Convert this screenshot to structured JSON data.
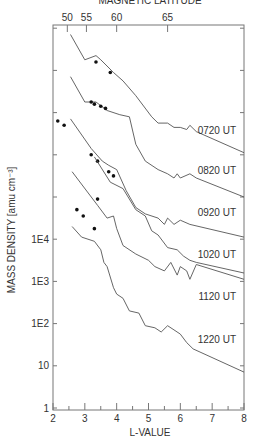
{
  "chart_data": {
    "type": "line",
    "title": "MAGNETIC LATITUDE",
    "xlabel": "L-VALUE",
    "ylabel": "MASS DENSITY [amu cm⁻³]",
    "x_range": [
      2,
      8
    ],
    "x_ticks": [
      "2",
      "3",
      "4",
      "5",
      "6",
      "7",
      "8"
    ],
    "top_axis": {
      "label": "MAGNETIC LATITUDE",
      "ticks": [
        {
          "label": "50",
          "L": 2.45
        },
        {
          "label": "55",
          "L": 3.05
        },
        {
          "label": "60",
          "L": 4.0
        },
        {
          "label": "65",
          "L": 5.6
        }
      ]
    },
    "y_scale": "log (curves offset by one decade each for clarity)",
    "y_tick_labels": [
      {
        "label": "1",
        "decade": 0
      },
      {
        "label": "10",
        "decade": 1
      },
      {
        "label": "1E2",
        "decade": 2
      },
      {
        "label": "1E3",
        "decade": 3
      },
      {
        "label": "1E4",
        "decade": 4
      }
    ],
    "y_extra_ticks_decades": [
      5,
      6,
      7,
      8,
      9
    ],
    "grid": false,
    "legend": "inline labels at right",
    "series": [
      {
        "name": "0720 UT",
        "points": [
          [
            2.55,
            8.85
          ],
          [
            3.0,
            8.25
          ],
          [
            3.35,
            8.35
          ],
          [
            3.5,
            8.25
          ],
          [
            3.9,
            7.95
          ],
          [
            4.2,
            7.75
          ],
          [
            4.6,
            7.4
          ],
          [
            5.1,
            6.9
          ],
          [
            5.3,
            6.75
          ],
          [
            5.6,
            6.75
          ],
          [
            5.8,
            6.65
          ],
          [
            6.0,
            6.65
          ],
          [
            6.2,
            6.6
          ],
          [
            6.3,
            6.7
          ],
          [
            6.5,
            6.55
          ],
          [
            8.0,
            6.05
          ]
        ],
        "label_pos": [
          7.75,
          6.5
        ],
        "dots": [
          [
            3.35,
            8.2
          ],
          [
            3.8,
            7.95
          ]
        ]
      },
      {
        "name": "0820 UT",
        "points": [
          [
            2.55,
            7.85
          ],
          [
            3.0,
            7.25
          ],
          [
            3.35,
            7.25
          ],
          [
            3.7,
            7.05
          ],
          [
            4.1,
            6.95
          ],
          [
            4.4,
            6.9
          ],
          [
            4.6,
            6.25
          ],
          [
            4.9,
            5.85
          ],
          [
            5.3,
            5.65
          ],
          [
            5.6,
            5.55
          ],
          [
            5.8,
            5.45
          ],
          [
            5.9,
            5.55
          ],
          [
            6.0,
            5.45
          ],
          [
            6.3,
            5.55
          ],
          [
            6.5,
            5.45
          ],
          [
            8.0,
            5.0
          ]
        ],
        "label_pos": [
          7.75,
          5.55
        ],
        "dots": [
          [
            3.2,
            7.25
          ],
          [
            3.3,
            7.2
          ],
          [
            3.5,
            7.15
          ],
          [
            3.65,
            7.1
          ]
        ]
      },
      {
        "name": "0920 UT",
        "points": [
          [
            2.55,
            6.85
          ],
          [
            3.2,
            6.15
          ],
          [
            3.55,
            5.85
          ],
          [
            3.75,
            5.75
          ],
          [
            4.0,
            5.65
          ],
          [
            4.3,
            5.15
          ],
          [
            4.6,
            4.75
          ],
          [
            4.9,
            4.6
          ],
          [
            5.3,
            4.5
          ],
          [
            5.5,
            4.35
          ],
          [
            5.6,
            4.5
          ],
          [
            5.8,
            4.35
          ],
          [
            6.0,
            4.45
          ],
          [
            6.3,
            4.35
          ],
          [
            8.0,
            4.05
          ]
        ],
        "label_pos": [
          7.75,
          4.55
        ],
        "dots": [
          [
            2.15,
            6.8
          ],
          [
            2.35,
            6.7
          ],
          [
            3.2,
            6.0
          ],
          [
            3.4,
            5.85
          ],
          [
            3.75,
            5.6
          ],
          [
            3.9,
            5.5
          ]
        ]
      },
      {
        "name": "1020 UT",
        "points": [
          [
            2.6,
            5.6
          ],
          [
            3.4,
            4.8
          ],
          [
            3.7,
            4.5
          ],
          [
            3.9,
            4.55
          ],
          [
            4.0,
            4.25
          ],
          [
            4.2,
            3.85
          ],
          [
            4.6,
            3.65
          ],
          [
            5.0,
            3.5
          ],
          [
            5.2,
            3.35
          ],
          [
            5.5,
            3.25
          ],
          [
            5.7,
            3.45
          ],
          [
            5.9,
            3.15
          ],
          [
            6.0,
            3.35
          ],
          [
            6.2,
            3.25
          ],
          [
            6.3,
            3.05
          ],
          [
            6.5,
            3.4
          ],
          [
            8.0,
            3.05
          ]
        ],
        "label_pos": [
          7.75,
          3.55
        ],
        "dots": [
          [
            2.75,
            4.7
          ],
          [
            2.95,
            4.55
          ],
          [
            3.3,
            4.25
          ],
          [
            3.4,
            4.95
          ]
        ]
      },
      {
        "name": "1120 UT",
        "points": [
          [
            2.6,
            4.3
          ],
          [
            2.9,
            4.05
          ],
          [
            3.3,
            3.95
          ],
          [
            3.5,
            3.75
          ],
          [
            3.6,
            3.45
          ],
          [
            3.7,
            3.35
          ],
          [
            3.9,
            2.85
          ],
          [
            4.0,
            2.7
          ],
          [
            4.2,
            2.6
          ],
          [
            4.4,
            2.3
          ],
          [
            4.7,
            2.25
          ],
          [
            4.9,
            1.95
          ],
          [
            5.2,
            1.9
          ],
          [
            5.4,
            1.8
          ],
          [
            5.6,
            1.95
          ],
          [
            5.8,
            1.85
          ],
          [
            6.0,
            1.75
          ],
          [
            6.2,
            1.55
          ],
          [
            6.4,
            1.4
          ],
          [
            8.0,
            0.85
          ]
        ],
        "label_pos": [
          7.75,
          2.55
        ],
        "dots": []
      },
      {
        "name": "1220 UT",
        "points": [
          [
            3.3,
            5.95
          ],
          [
            3.8,
            5.35
          ],
          [
            4.2,
            5.2
          ],
          [
            4.6,
            4.7
          ],
          [
            4.9,
            4.55
          ],
          [
            5.1,
            4.2
          ],
          [
            5.3,
            4.1
          ],
          [
            5.6,
            3.8
          ],
          [
            5.9,
            3.75
          ],
          [
            6.1,
            3.6
          ],
          [
            6.3,
            3.5
          ],
          [
            6.5,
            3.45
          ],
          [
            8.0,
            3.2
          ]
        ],
        "label_pos": [
          7.75,
          1.55
        ],
        "dots": []
      }
    ]
  }
}
